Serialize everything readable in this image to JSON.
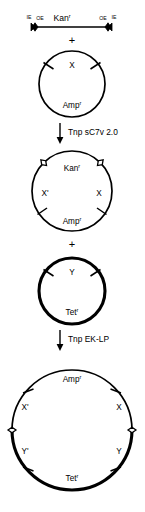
{
  "figure": {
    "colors": {
      "stroke": "#000000",
      "background": "#ffffff",
      "marker_fill_open": "#ffffff",
      "marker_fill_solid": "#000000"
    }
  },
  "transposon": {
    "name": "donor-transposon-bar",
    "cargo_label": "Kan",
    "cargo_superscript": "r",
    "end_labels": {
      "outer_left": "IE",
      "inner_left": "OE",
      "inner_right": "OE",
      "outer_right": "IE"
    },
    "end_marker_icon": "diamond-marker-solid"
  },
  "operators": {
    "plus_1": "+",
    "plus_2": "+"
  },
  "steps": [
    {
      "name": "step-tnp-sc7v",
      "label": "Tnp sC7v 2.0",
      "arrow_icon": "arrow-down-icon"
    },
    {
      "name": "step-tnp-eklp",
      "label": "Tnp EK-LP",
      "arrow_icon": "arrow-down-icon"
    }
  ],
  "plasmids": [
    {
      "name": "plasmid-target-x",
      "stroke": "thin",
      "labels": {
        "top": "X",
        "top_superscript": "",
        "bottom": "Amp",
        "bottom_superscript": "r",
        "left": "",
        "right": ""
      },
      "tick_icons": [
        "tick-mark-left",
        "tick-mark-right"
      ],
      "diamond_icons": []
    },
    {
      "name": "plasmid-kan-insert",
      "stroke": "thin",
      "labels": {
        "top": "Kan",
        "top_superscript": "r",
        "bottom": "Amp",
        "bottom_superscript": "r",
        "left": "X'",
        "right": "X"
      },
      "tick_icons": [
        "tick-mark-lower-left",
        "tick-mark-lower-right"
      ],
      "diamond_icons": [
        "diamond-marker-upper-left",
        "diamond-marker-upper-right"
      ]
    },
    {
      "name": "plasmid-target-y",
      "stroke": "thick",
      "labels": {
        "top": "Y",
        "top_superscript": "",
        "bottom": "Tet",
        "bottom_superscript": "r",
        "left": "",
        "right": ""
      },
      "tick_icons": [
        "tick-mark-left",
        "tick-mark-right"
      ],
      "diamond_icons": []
    },
    {
      "name": "plasmid-cointegrate",
      "stroke": "mixed",
      "labels": {
        "top": "Amp",
        "top_superscript": "r",
        "bottom": "Tet",
        "bottom_superscript": "r",
        "upper_left": "X'",
        "upper_right": "X",
        "lower_left": "Y'",
        "lower_right": "Y"
      },
      "tick_icons": [
        "tick-mark-upper-left",
        "tick-mark-upper-right",
        "tick-mark-lower-left",
        "tick-mark-lower-right"
      ],
      "diamond_icons": [
        "diamond-marker-left",
        "diamond-marker-right"
      ]
    }
  ]
}
